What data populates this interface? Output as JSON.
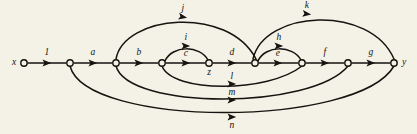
{
  "figure": {
    "kind": "directed-graph-diagram",
    "background_color": "#f4f2e6",
    "ink_color": "#161310",
    "width": 417,
    "height": 134
  },
  "nodes": [
    {
      "id": "x",
      "label": "x",
      "cx": 24,
      "cy": 63,
      "r": 3.2,
      "label_x": 14,
      "label_y": 63,
      "labeled": true
    },
    {
      "id": "n1",
      "label": "",
      "cx": 70,
      "cy": 63,
      "r": 3.2,
      "label_x": 70,
      "label_y": 63,
      "labeled": false
    },
    {
      "id": "n2",
      "label": "",
      "cx": 116,
      "cy": 63,
      "r": 3.2,
      "label_x": 116,
      "label_y": 63,
      "labeled": false
    },
    {
      "id": "n3",
      "label": "",
      "cx": 162,
      "cy": 63,
      "r": 3.2,
      "label_x": 162,
      "label_y": 63,
      "labeled": false
    },
    {
      "id": "z",
      "label": "z",
      "cx": 209,
      "cy": 63,
      "r": 3.2,
      "label_x": 209,
      "label_y": 73,
      "labeled": true
    },
    {
      "id": "n4",
      "label": "",
      "cx": 255,
      "cy": 63,
      "r": 3.2,
      "label_x": 255,
      "label_y": 63,
      "labeled": false
    },
    {
      "id": "n5",
      "label": "",
      "cx": 302,
      "cy": 63,
      "r": 3.2,
      "label_x": 302,
      "label_y": 63,
      "labeled": false
    },
    {
      "id": "n6",
      "label": "",
      "cx": 348,
      "cy": 63,
      "r": 3.2,
      "label_x": 348,
      "label_y": 63,
      "labeled": false
    },
    {
      "id": "y",
      "label": "y",
      "cx": 394,
      "cy": 63,
      "r": 3.2,
      "label_x": 404,
      "label_y": 63,
      "labeled": true
    }
  ],
  "edges": [
    {
      "id": "edge-1",
      "label": "1",
      "from": "x",
      "to": "n1",
      "path": "M 28,63 L 66,63",
      "arrow": {
        "x": 47,
        "y": 63,
        "angle": 0
      },
      "label_x": 47,
      "label_y": 53
    },
    {
      "id": "edge-a",
      "label": "a",
      "from": "n1",
      "to": "n2",
      "path": "M 74,63 L 112,63",
      "arrow": {
        "x": 93,
        "y": 63,
        "angle": 0
      },
      "label_x": 93,
      "label_y": 53
    },
    {
      "id": "edge-b",
      "label": "b",
      "from": "n2",
      "to": "n3",
      "path": "M 120,63 L 158,63",
      "arrow": {
        "x": 139,
        "y": 63,
        "angle": 0
      },
      "label_x": 139,
      "label_y": 53
    },
    {
      "id": "edge-c",
      "label": "c",
      "from": "n3",
      "to": "z",
      "path": "M 166,63 L 205,63",
      "arrow": {
        "x": 186,
        "y": 63,
        "angle": 0
      },
      "label_x": 186,
      "label_y": 54
    },
    {
      "id": "edge-d",
      "label": "d",
      "from": "z",
      "to": "n4",
      "path": "M 213,63 L 251,63",
      "arrow": {
        "x": 232,
        "y": 63,
        "angle": 0
      },
      "label_x": 232,
      "label_y": 53
    },
    {
      "id": "edge-e",
      "label": "e",
      "from": "n4",
      "to": "n5",
      "path": "M 259,63 L 298,63",
      "arrow": {
        "x": 278,
        "y": 63,
        "angle": 0
      },
      "label_x": 278,
      "label_y": 54
    },
    {
      "id": "edge-f",
      "label": "f",
      "from": "n5",
      "to": "n6",
      "path": "M 306,63 L 344,63",
      "arrow": {
        "x": 325,
        "y": 63,
        "angle": 0
      },
      "label_x": 325,
      "label_y": 53
    },
    {
      "id": "edge-g",
      "label": "g",
      "from": "n6",
      "to": "y",
      "path": "M 352,63 L 390,63",
      "arrow": {
        "x": 371,
        "y": 63,
        "angle": 0
      },
      "label_x": 371,
      "label_y": 53
    },
    {
      "id": "edge-i",
      "label": "i",
      "from": "n3",
      "to": "z",
      "path": "M 165,61 C 172,45 200,45 208,60",
      "arrow": {
        "x": 186,
        "y": 46,
        "angle": 0
      },
      "label_x": 186,
      "label_y": 38
    },
    {
      "id": "edge-h",
      "label": "h",
      "from": "n4",
      "to": "n5",
      "path": "M 258,61 C 265,45 293,45 301,60",
      "arrow": {
        "x": 279,
        "y": 46,
        "angle": 0
      },
      "label_x": 279,
      "label_y": 38
    },
    {
      "id": "edge-j",
      "label": "j",
      "from": "n2",
      "to": "n4",
      "path": "M 116,59 C 124,15 228,5 256,59",
      "arrow": {
        "x": 183,
        "y": 17,
        "angle": 10
      },
      "label_x": 183,
      "label_y": 9
    },
    {
      "id": "edge-k",
      "label": "k",
      "from": "n4",
      "to": "y",
      "path": "M 253,59 C 264,10 370,4 394,59",
      "arrow": {
        "x": 307,
        "y": 14,
        "angle": 7
      },
      "label_x": 307,
      "label_y": 6
    },
    {
      "id": "edge-l",
      "label": "l",
      "from": "n3",
      "to": "n5",
      "path": "M 162,66 C 172,93 268,93 302,66",
      "arrow": {
        "x": 232,
        "y": 84,
        "angle": 0
      },
      "label_x": 232,
      "label_y": 77
    },
    {
      "id": "edge-m",
      "label": "m",
      "from": "n2",
      "to": "n6",
      "path": "M 116,66 C 128,110 312,110 348,66",
      "arrow": {
        "x": 232,
        "y": 100,
        "angle": 0
      },
      "label_x": 232,
      "label_y": 93
    },
    {
      "id": "edge-n",
      "label": "n",
      "from": "n1",
      "to": "y",
      "path": "M 70,66 C 86,128 358,128 394,66",
      "arrow": {
        "x": 232,
        "y": 117,
        "angle": 0
      },
      "label_x": 232,
      "label_y": 126
    }
  ]
}
